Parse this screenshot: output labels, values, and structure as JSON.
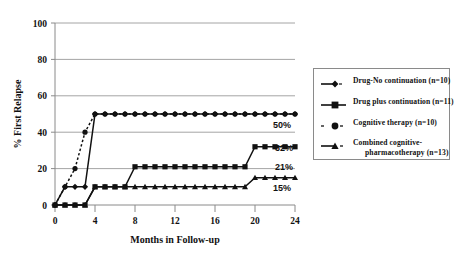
{
  "chart_data": {
    "type": "line",
    "title": "",
    "subtitle": "",
    "xlabel": "Months in Follow-up",
    "ylabel": "% First Relapse",
    "xlim": [
      0,
      24
    ],
    "ylim": [
      0,
      100
    ],
    "xticks": [
      0,
      4,
      8,
      12,
      16,
      20,
      24
    ],
    "yticks": [
      0,
      20,
      40,
      60,
      80,
      100
    ],
    "xtick_labels": [
      "0",
      "4",
      "8",
      "12",
      "16",
      "20",
      "24"
    ],
    "ytick_labels": [
      "0",
      "20",
      "40",
      "60",
      "80",
      "100"
    ],
    "grid": "horizontal",
    "legend_position": "right",
    "series": [
      {
        "name": "Drug-No continuation (n=10)",
        "marker": "diamond",
        "line_style": "solid",
        "endpoint_label": "50%",
        "x": [
          0,
          1,
          2,
          3,
          4,
          5,
          6,
          7,
          8,
          9,
          10,
          11,
          12,
          13,
          14,
          15,
          16,
          17,
          18,
          19,
          20,
          21,
          22,
          23,
          24
        ],
        "y": [
          0,
          10,
          10,
          10,
          50,
          50,
          50,
          50,
          50,
          50,
          50,
          50,
          50,
          50,
          50,
          50,
          50,
          50,
          50,
          50,
          50,
          50,
          50,
          50,
          50
        ]
      },
      {
        "name": "Drug plus continuation (n=11)",
        "marker": "square",
        "line_style": "solid",
        "endpoint_label": "32%",
        "x": [
          0,
          1,
          2,
          3,
          4,
          5,
          6,
          7,
          8,
          9,
          10,
          11,
          12,
          13,
          14,
          15,
          16,
          17,
          18,
          19,
          20,
          21,
          22,
          23,
          24
        ],
        "y": [
          0,
          0,
          0,
          0,
          10,
          10,
          10,
          10,
          21,
          21,
          21,
          21,
          21,
          21,
          21,
          21,
          21,
          21,
          21,
          21,
          32,
          32,
          32,
          32,
          32
        ]
      },
      {
        "name": "Cognitive therapy (n=10)",
        "marker": "circle",
        "line_style": "dotted",
        "endpoint_label": "21%",
        "x": [
          0,
          1,
          2,
          3,
          4,
          5,
          6,
          7,
          8,
          9,
          10,
          11,
          12,
          13,
          14,
          15,
          16,
          17,
          18,
          19,
          20,
          21,
          22,
          23,
          24
        ],
        "y": [
          0,
          10,
          20,
          40,
          50,
          50,
          50,
          50,
          50,
          50,
          50,
          50,
          50,
          50,
          50,
          50,
          50,
          50,
          50,
          50,
          50,
          50,
          50,
          50,
          50
        ]
      },
      {
        "name": "Combined cognitive-pharmacotherapy (n=13)",
        "marker": "triangle",
        "line_style": "solid",
        "endpoint_label": "15%",
        "x": [
          0,
          1,
          2,
          3,
          4,
          5,
          6,
          7,
          8,
          9,
          10,
          11,
          12,
          13,
          14,
          15,
          16,
          17,
          18,
          19,
          20,
          21,
          22,
          23,
          24
        ],
        "y": [
          0,
          0,
          0,
          0,
          10,
          10,
          10,
          10,
          10,
          10,
          10,
          10,
          10,
          10,
          10,
          10,
          10,
          10,
          10,
          10,
          15,
          15,
          15,
          15,
          15
        ]
      }
    ],
    "endpoint_labels": [
      {
        "text": "50%",
        "value": 50
      },
      {
        "text": "32%",
        "value": 32
      },
      {
        "text": "21%",
        "value": 21
      },
      {
        "text": "15%",
        "value": 15
      }
    ]
  },
  "axes": {
    "y_title": "% First Relapse",
    "x_title": "Months in Follow-up",
    "x_tick_0": "0",
    "x_tick_1": "4",
    "x_tick_2": "8",
    "x_tick_3": "12",
    "x_tick_4": "16",
    "x_tick_5": "20",
    "x_tick_6": "24",
    "y_tick_0": "0",
    "y_tick_1": "20",
    "y_tick_2": "40",
    "y_tick_3": "60",
    "y_tick_4": "80",
    "y_tick_5": "100"
  },
  "annotations": {
    "label_50": "50%",
    "label_32": "32%",
    "label_21": "21%",
    "label_15": "15%"
  },
  "legend": {
    "items": [
      {
        "label": "Drug-No continuation (n=10)",
        "marker": "diamond-icon",
        "line": "solid"
      },
      {
        "label": "Drug plus continuation (n=11)",
        "marker": "square-icon",
        "line": "solid"
      },
      {
        "label": "Cognitive therapy (n=10)",
        "marker": "circle-icon",
        "line": "dotted"
      },
      {
        "label": "Combined cognitive-",
        "label_cont": "pharmacotherapy (n=13)",
        "marker": "triangle-icon",
        "line": "solid"
      }
    ]
  },
  "colors": {
    "series": "#111111",
    "grid": "#9a9a9a",
    "axis": "#8a8a8a",
    "background": "#ffffff"
  }
}
